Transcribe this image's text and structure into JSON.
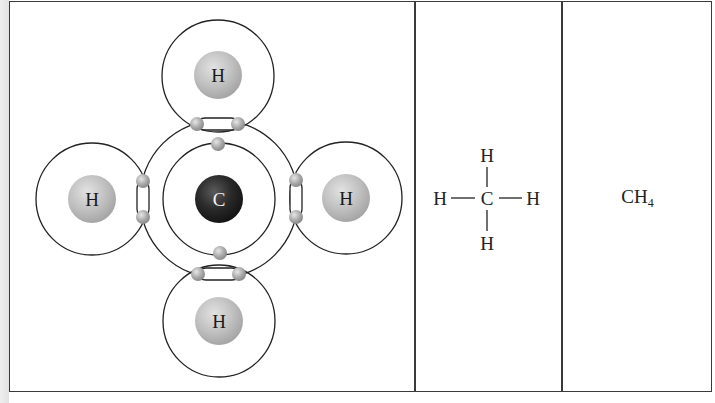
{
  "figure": {
    "panels": [
      {
        "id": "electron-dot-model",
        "central_atom": {
          "symbol": "C",
          "color": "#2a2a2a"
        },
        "outer_atoms": [
          {
            "symbol": "H",
            "position": "top"
          },
          {
            "symbol": "H",
            "position": "left"
          },
          {
            "symbol": "H",
            "position": "right"
          },
          {
            "symbol": "H",
            "position": "bottom"
          }
        ],
        "hydrogen_color": "#bdbdbd",
        "electron_color": "#a8a8a8",
        "shared_electron_pairs": 4,
        "inner_shell_electrons": 2
      },
      {
        "id": "structural-formula",
        "center": "C",
        "top": "H",
        "left": "H",
        "right": "H",
        "bottom": "H"
      },
      {
        "id": "molecular-formula",
        "base": "CH",
        "subscript": "4"
      }
    ]
  }
}
